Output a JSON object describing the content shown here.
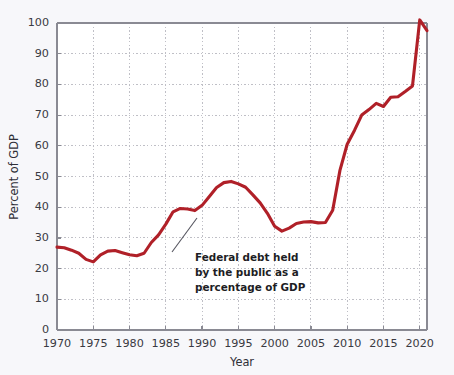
{
  "chart_data": {
    "type": "line",
    "title": "",
    "subtitle": "",
    "xlabel": "Year",
    "ylabel": "Percent of GDP",
    "xlim": [
      1970,
      2021
    ],
    "ylim": [
      0,
      100
    ],
    "xticks": [
      1970,
      1975,
      1980,
      1985,
      1990,
      1995,
      2000,
      2005,
      2010,
      2015,
      2020
    ],
    "yticks": [
      0,
      10,
      20,
      30,
      40,
      50,
      60,
      70,
      80,
      90,
      100
    ],
    "grid": true,
    "legend": "none",
    "line_color": "#b02028",
    "annotations": [
      {
        "text_lines": [
          "Federal debt held",
          "by the public as a",
          "percentage of GDP"
        ],
        "points_to_year": 1987,
        "points_to_value": 39
      }
    ],
    "series": [
      {
        "name": "Federal debt held by the public as a percentage of GDP",
        "x": [
          1970,
          1971,
          1972,
          1973,
          1974,
          1975,
          1976,
          1977,
          1978,
          1979,
          1980,
          1981,
          1982,
          1983,
          1984,
          1985,
          1986,
          1987,
          1988,
          1989,
          1990,
          1991,
          1992,
          1993,
          1994,
          1995,
          1996,
          1997,
          1998,
          1999,
          2000,
          2001,
          2002,
          2003,
          2004,
          2005,
          2006,
          2007,
          2008,
          2009,
          2010,
          2011,
          2012,
          2013,
          2014,
          2015,
          2016,
          2017,
          2018,
          2019,
          2020,
          2021
        ],
        "values": [
          27.0,
          26.8,
          26.0,
          25.0,
          23.0,
          22.2,
          24.5,
          25.7,
          25.9,
          25.2,
          24.5,
          24.2,
          25.0,
          28.5,
          31.0,
          34.5,
          38.5,
          39.6,
          39.4,
          38.9,
          40.6,
          43.5,
          46.4,
          48.0,
          48.4,
          47.6,
          46.5,
          44.0,
          41.4,
          38.0,
          33.8,
          32.2,
          33.2,
          34.7,
          35.2,
          35.3,
          34.9,
          35.0,
          39.0,
          52.0,
          60.5,
          65.0,
          70.0,
          71.8,
          73.8,
          72.8,
          75.8,
          76.0,
          77.7,
          79.5,
          101.0,
          97.5
        ]
      }
    ]
  },
  "axis": {
    "y_title": "Percent of GDP",
    "x_title": "Year",
    "y_tick_labels": [
      "0",
      "10",
      "20",
      "30",
      "40",
      "50",
      "60",
      "70",
      "80",
      "90",
      "100"
    ],
    "x_tick_labels": [
      "1970",
      "1975",
      "1980",
      "1985",
      "1990",
      "1995",
      "2000",
      "2005",
      "2010",
      "2015",
      "2020"
    ]
  },
  "annotation": {
    "line1": "Federal debt held",
    "line2": "by the public as a",
    "line3": "percentage of GDP"
  }
}
